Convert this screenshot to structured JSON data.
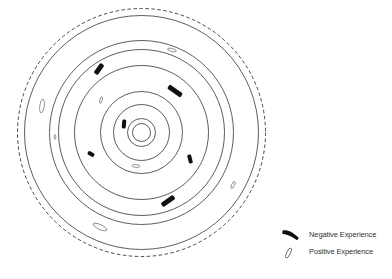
{
  "diagram": {
    "center": {
      "x": 141.5,
      "y": 132.5
    },
    "rings": [
      {
        "r": 124,
        "style": "dashed"
      },
      {
        "r": 117,
        "style": "solid"
      },
      {
        "r": 92,
        "style": "solid"
      },
      {
        "r": 83,
        "style": "solid"
      },
      {
        "r": 67,
        "style": "solid"
      },
      {
        "r": 41,
        "style": "solid"
      },
      {
        "r": 28,
        "style": "solid"
      },
      {
        "r": 14,
        "style": "solid"
      },
      {
        "r": 9,
        "style": "solid"
      }
    ],
    "negative_marks": [
      {
        "x": 99,
        "y": 69,
        "len": 12,
        "w": 5,
        "angle": -55
      },
      {
        "x": 175,
        "y": 91,
        "len": 16,
        "w": 5,
        "angle": 35
      },
      {
        "x": 124,
        "y": 124,
        "len": 9,
        "w": 4,
        "angle": -85
      },
      {
        "x": 91,
        "y": 154,
        "len": 7,
        "w": 4,
        "angle": 30
      },
      {
        "x": 190,
        "y": 159,
        "len": 9,
        "w": 4,
        "angle": 75
      },
      {
        "x": 168,
        "y": 201,
        "len": 15,
        "w": 5,
        "angle": -35
      }
    ],
    "positive_marks": [
      {
        "x": 172,
        "y": 50,
        "rx": 4.5,
        "ry": 1.5,
        "angle": 15
      },
      {
        "x": 42,
        "y": 106,
        "rx": 2.2,
        "ry": 7,
        "angle": 8
      },
      {
        "x": 101,
        "y": 100,
        "rx": 1.2,
        "ry": 3.5,
        "angle": 15
      },
      {
        "x": 55,
        "y": 137,
        "rx": 0.8,
        "ry": 2.5,
        "angle": 0
      },
      {
        "x": 136,
        "y": 166,
        "rx": 4,
        "ry": 1.4,
        "angle": 5
      },
      {
        "x": 233,
        "y": 185,
        "rx": 1.4,
        "ry": 3.8,
        "angle": 25
      },
      {
        "x": 100,
        "y": 227,
        "rx": 7.5,
        "ry": 2.4,
        "angle": 25
      }
    ]
  },
  "legend": {
    "items": [
      {
        "type": "negative",
        "label": "Negative Experience"
      },
      {
        "type": "positive",
        "label": "Positive Experience"
      }
    ]
  },
  "colors": {
    "line": "#333333",
    "negative": "#111111",
    "background": "#ffffff"
  }
}
